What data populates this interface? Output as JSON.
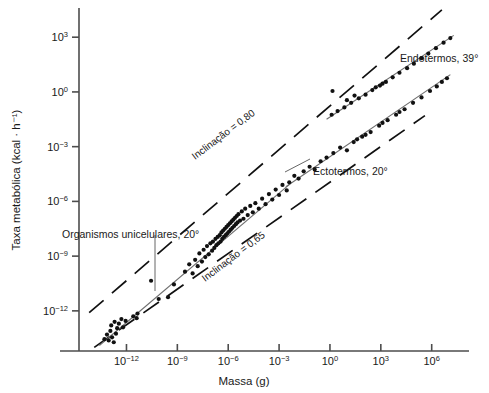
{
  "chart_data": {
    "type": "scatter",
    "title": "",
    "xlabel": "Massa (g)",
    "ylabel": "Taxa metabólica (kcal · h⁻¹)",
    "xlabel_plain": "Massa (g)",
    "ylabel_plain": "Taxa metabolica (kcal . h-1)",
    "xscale": "log10",
    "yscale": "log10",
    "xlim": [
      -14.8,
      8.2
    ],
    "ylim": [
      -14.2,
      4.6
    ],
    "grid": false,
    "legend": false,
    "xticks": [
      -12,
      -9,
      -6,
      -3,
      0,
      3,
      6
    ],
    "xticklabels": [
      "10-12",
      "10-9",
      "10-6",
      "10-3",
      "100",
      "103",
      "106"
    ],
    "xtick_mantissa": "10",
    "xtick_exponents": [
      "−12",
      "−9",
      "−6",
      "−3",
      "0",
      "3",
      "6"
    ],
    "yticks": [
      3,
      0,
      -3,
      -6,
      -9,
      -12
    ],
    "ytick_mantissa": "10",
    "ytick_exponents": [
      "3",
      "0",
      "−3",
      "−6",
      "−9",
      "−12"
    ],
    "annotations": [
      {
        "id": "unicellular",
        "text": "Organismos unicelulares, 20°",
        "x": -9.0,
        "y": -7.6
      },
      {
        "id": "ectotherms",
        "text": "Ectotermos, 20°",
        "x": 0.5,
        "y": -4.6
      },
      {
        "id": "endotherms",
        "text": "Endotermos, 39°",
        "x": 4.2,
        "y": 1.6
      },
      {
        "id": "slope-upper",
        "text": "Inclinação = 0,80",
        "x": -6.4,
        "y": -3.4,
        "rotation": -38
      },
      {
        "id": "slope-lower",
        "text": "Inclinação = 0,65",
        "x": -1.0,
        "y": -8.6,
        "rotation": -38
      }
    ],
    "series": [
      {
        "name": "Organismos unicelulares, 20°",
        "temperature_c": 20,
        "marker": "filled-circle",
        "color": "#111111",
        "regression_slope": 0.75,
        "points_log10": [
          [
            -13.3,
            -13.55
          ],
          [
            -13.15,
            -13.3
          ],
          [
            -13.05,
            -13.62
          ],
          [
            -12.95,
            -13.1
          ],
          [
            -12.85,
            -13.45
          ],
          [
            -12.75,
            -13.72
          ],
          [
            -12.62,
            -13.25
          ],
          [
            -12.55,
            -12.95
          ],
          [
            -12.9,
            -12.8
          ],
          [
            -12.7,
            -12.6
          ],
          [
            -12.45,
            -12.7
          ],
          [
            -12.3,
            -12.45
          ],
          [
            -12.2,
            -12.9
          ],
          [
            -12.05,
            -12.55
          ],
          [
            -11.6,
            -12.3
          ],
          [
            -11.4,
            -12.4
          ],
          [
            -11.35,
            -12.15
          ],
          [
            -10.55,
            -10.35
          ],
          [
            -10.1,
            -11.35
          ],
          [
            -9.55,
            -11.25
          ],
          [
            -9.2,
            -10.55
          ],
          [
            -8.55,
            -9.85
          ],
          [
            -8.3,
            -9.45
          ],
          [
            -8.1,
            -9.95
          ],
          [
            -7.95,
            -9.2
          ],
          [
            -7.8,
            -9.55
          ],
          [
            -7.7,
            -8.85
          ],
          [
            -7.55,
            -9.3
          ],
          [
            -7.45,
            -8.65
          ],
          [
            -7.35,
            -9.05
          ],
          [
            -7.25,
            -8.45
          ],
          [
            -7.15,
            -8.9
          ],
          [
            -7.05,
            -8.3
          ],
          [
            -6.95,
            -8.7
          ],
          [
            -6.9,
            -8.2
          ],
          [
            -6.82,
            -8.55
          ],
          [
            -6.75,
            -8.05
          ],
          [
            -6.7,
            -8.4
          ],
          [
            -6.62,
            -7.95
          ],
          [
            -6.58,
            -8.3
          ],
          [
            -6.5,
            -7.85
          ],
          [
            -6.45,
            -8.2
          ],
          [
            -6.4,
            -7.7
          ],
          [
            -6.35,
            -8.05
          ],
          [
            -6.3,
            -7.6
          ],
          [
            -6.25,
            -7.95
          ],
          [
            -6.2,
            -7.5
          ],
          [
            -6.15,
            -7.85
          ],
          [
            -6.1,
            -7.4
          ],
          [
            -6.05,
            -7.75
          ],
          [
            -6.0,
            -7.3
          ],
          [
            -5.95,
            -7.65
          ],
          [
            -5.9,
            -7.2
          ],
          [
            -5.85,
            -7.55
          ],
          [
            -5.8,
            -7.1
          ],
          [
            -5.75,
            -7.45
          ],
          [
            -5.7,
            -7.0
          ],
          [
            -5.65,
            -7.35
          ],
          [
            -5.6,
            -6.9
          ],
          [
            -5.55,
            -7.25
          ],
          [
            -5.5,
            -6.8
          ],
          [
            -5.45,
            -7.15
          ],
          [
            -5.4,
            -6.7
          ],
          [
            -5.3,
            -7.05
          ],
          [
            -5.2,
            -6.55
          ],
          [
            -5.1,
            -6.95
          ],
          [
            -5.0,
            -6.4
          ],
          [
            -4.85,
            -6.75
          ],
          [
            -4.7,
            -6.25
          ],
          [
            -4.55,
            -6.6
          ],
          [
            -4.4,
            -6.1
          ],
          [
            -4.2,
            -6.4
          ],
          [
            -4.0,
            -5.85
          ],
          [
            -3.8,
            -6.15
          ],
          [
            -3.6,
            -5.6
          ],
          [
            -3.4,
            -5.9
          ],
          [
            -3.2,
            -5.35
          ],
          [
            -3.0,
            -5.65
          ],
          [
            -2.8,
            -5.1
          ],
          [
            -2.55,
            -5.4
          ]
        ]
      },
      {
        "name": "Ectotermos, 20°",
        "temperature_c": 20,
        "marker": "filled-circle",
        "color": "#111111",
        "regression_slope": 0.75,
        "points_log10": [
          [
            -2.4,
            -4.95
          ],
          [
            -2.1,
            -4.6
          ],
          [
            -1.85,
            -4.75
          ],
          [
            -1.55,
            -4.35
          ],
          [
            -1.2,
            -4.1
          ],
          [
            -0.9,
            -4.25
          ],
          [
            -0.55,
            -3.8
          ],
          [
            -0.2,
            -3.6
          ],
          [
            0.2,
            -3.35
          ],
          [
            0.6,
            -3.05
          ],
          [
            1.0,
            -3.2
          ],
          [
            1.4,
            -2.75
          ],
          [
            1.9,
            -2.45
          ],
          [
            2.4,
            -2.2
          ],
          [
            2.9,
            -1.85
          ],
          [
            3.4,
            -1.55
          ],
          [
            3.9,
            -1.25
          ],
          [
            4.4,
            -0.95
          ],
          [
            4.9,
            -0.6
          ],
          [
            5.4,
            -0.3
          ],
          [
            5.9,
            0.05
          ],
          [
            6.3,
            0.3
          ],
          [
            6.6,
            0.55
          ],
          [
            6.9,
            0.75
          ],
          [
            1.6,
            -2.6
          ],
          [
            2.1,
            -2.35
          ],
          [
            3.1,
            -1.7
          ],
          [
            4.1,
            -1.1
          ]
        ]
      },
      {
        "name": "Endotermos, 39°",
        "temperature_c": 39,
        "marker": "filled-circle",
        "color": "#111111",
        "regression_slope": 0.75,
        "points_log10": [
          [
            0.1,
            -1.25
          ],
          [
            0.45,
            -1.05
          ],
          [
            0.85,
            -0.85
          ],
          [
            1.25,
            -0.6
          ],
          [
            1.7,
            -0.35
          ],
          [
            2.1,
            -0.15
          ],
          [
            2.5,
            0.1
          ],
          [
            2.95,
            0.35
          ],
          [
            3.3,
            0.55
          ],
          [
            3.7,
            0.8
          ],
          [
            4.1,
            1.05
          ],
          [
            4.55,
            1.3
          ],
          [
            4.95,
            1.55
          ],
          [
            5.4,
            1.85
          ],
          [
            5.8,
            2.1
          ],
          [
            6.25,
            2.4
          ],
          [
            6.7,
            2.7
          ],
          [
            7.1,
            2.95
          ],
          [
            2.7,
            0.25
          ],
          [
            3.1,
            0.45
          ],
          [
            1.0,
            -0.45
          ],
          [
            1.45,
            -0.2
          ],
          [
            0.15,
            0.05
          ]
        ]
      }
    ],
    "regression_lines": [
      {
        "id": "unicellular-line",
        "x1": -13.6,
        "y1": -13.9,
        "x2": -2.3,
        "y2": -5.0,
        "style": "solid",
        "color": "#6e6e6e"
      },
      {
        "id": "ectotherm-line",
        "x1": -2.6,
        "y1": -5.2,
        "x2": 7.1,
        "y2": 0.95,
        "style": "solid",
        "color": "#6e6e6e"
      },
      {
        "id": "endotherm-line",
        "x1": -0.2,
        "y1": -1.5,
        "x2": 7.3,
        "y2": 3.1,
        "style": "solid",
        "color": "#6e6e6e"
      }
    ],
    "reference_lines": [
      {
        "id": "slope-080-line",
        "label": "Inclinação = 0,80",
        "slope": 0.8,
        "style": "dashed",
        "color": "#111111",
        "x1": -14.2,
        "y1": -12.1,
        "x2": 6.6,
        "y2": 4.5
      },
      {
        "id": "slope-065-line",
        "label": "Inclinação = 0,65",
        "slope": 0.65,
        "style": "dashed",
        "color": "#111111",
        "x1": -13.9,
        "y1": -14.0,
        "x2": 5.6,
        "y2": -1.3
      }
    ]
  }
}
